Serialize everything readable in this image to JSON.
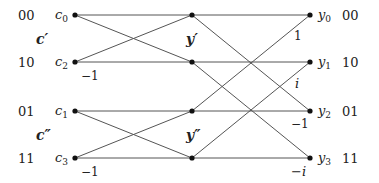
{
  "diagram": {
    "type": "butterfly-network",
    "left_codes": [
      "00",
      "10",
      "01",
      "11"
    ],
    "right_codes": [
      "00",
      "10",
      "01",
      "11"
    ],
    "inputs": [
      {
        "name": "c",
        "sub": "0"
      },
      {
        "name": "c",
        "sub": "2"
      },
      {
        "name": "c",
        "sub": "1"
      },
      {
        "name": "c",
        "sub": "3"
      }
    ],
    "outputs": [
      {
        "name": "y",
        "sub": "0"
      },
      {
        "name": "y",
        "sub": "1"
      },
      {
        "name": "y",
        "sub": "2"
      },
      {
        "name": "y",
        "sub": "3"
      }
    ],
    "group_labels": {
      "c_top": "c′",
      "c_bottom": "c″",
      "y_top": "y′",
      "y_bottom": "y″"
    },
    "stage1_weights": [
      "−1",
      "−1"
    ],
    "stage2_weights": [
      "1",
      "i",
      "−1",
      "−i"
    ],
    "line_color": "#555555",
    "node_color": "#111111"
  }
}
